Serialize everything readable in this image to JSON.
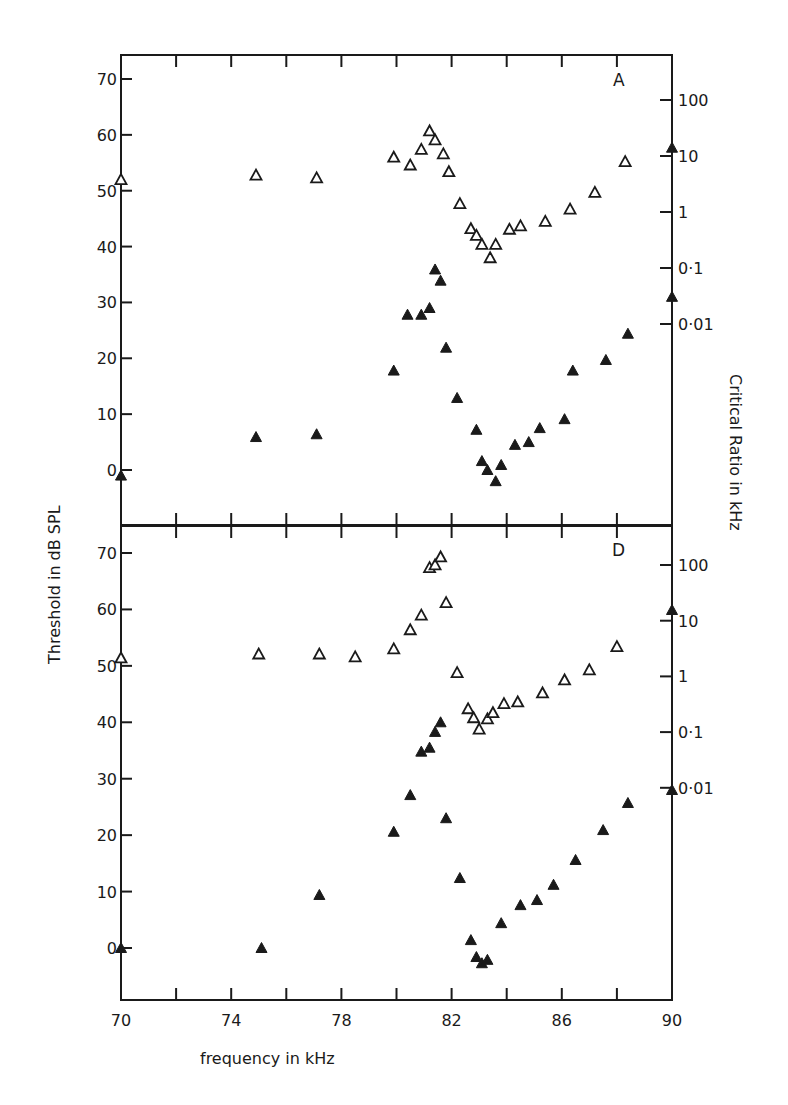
{
  "chart_data": [
    {
      "type": "scatter",
      "panel_label": "A",
      "xlabel": "frequency in kHz",
      "ylabel": "Threshold in dB SPL",
      "y2label": "Critical Ratio in kHz",
      "xlim": [
        70,
        90
      ],
      "ylim": [
        -10,
        75
      ],
      "x_ticks": [
        70,
        72,
        74,
        76,
        78,
        80,
        82,
        84,
        86,
        88,
        90
      ],
      "x_tick_labels": [
        "70",
        "74",
        "78",
        "82",
        "86",
        "90"
      ],
      "y_ticks": [
        0,
        10,
        20,
        30,
        40,
        50,
        60,
        70
      ],
      "y2_ticks": [
        "100",
        "10",
        "1",
        "0·1",
        "0·01"
      ],
      "series": [
        {
          "name": "critical ratio (open triangles)",
          "marker": "open-triangle",
          "points": [
            [
              70.0,
              52
            ],
            [
              74.9,
              52.8
            ],
            [
              77.1,
              52.3
            ],
            [
              79.9,
              56
            ],
            [
              80.5,
              54.6
            ],
            [
              80.9,
              57.4
            ],
            [
              81.2,
              60.7
            ],
            [
              81.4,
              59.1
            ],
            [
              81.7,
              56.6
            ],
            [
              81.9,
              53.4
            ],
            [
              82.3,
              47.7
            ],
            [
              82.7,
              43.2
            ],
            [
              82.9,
              42
            ],
            [
              83.1,
              40.4
            ],
            [
              83.4,
              38
            ],
            [
              83.6,
              40.4
            ],
            [
              84.1,
              43.1
            ],
            [
              84.5,
              43.7
            ],
            [
              85.4,
              44.5
            ],
            [
              86.3,
              46.7
            ],
            [
              87.2,
              49.7
            ],
            [
              88.3,
              55.2
            ]
          ]
        },
        {
          "name": "threshold (filled triangles)",
          "marker": "filled-triangle",
          "points": [
            [
              70.0,
              -1
            ],
            [
              74.9,
              5.9
            ],
            [
              77.1,
              6.4
            ],
            [
              79.9,
              17.8
            ],
            [
              80.4,
              27.8
            ],
            [
              80.9,
              27.8
            ],
            [
              81.2,
              29
            ],
            [
              81.4,
              35.9
            ],
            [
              81.6,
              33.9
            ],
            [
              81.8,
              21.9
            ],
            [
              82.2,
              12.9
            ],
            [
              82.9,
              7.2
            ],
            [
              83.1,
              1.6
            ],
            [
              83.3,
              0
            ],
            [
              83.6,
              -2
            ],
            [
              83.8,
              0.9
            ],
            [
              84.3,
              4.5
            ],
            [
              84.8,
              5
            ],
            [
              85.2,
              7.5
            ],
            [
              86.1,
              9.1
            ],
            [
              86.4,
              17.8
            ],
            [
              87.6,
              19.7
            ],
            [
              88.4,
              24.4
            ],
            [
              90.0,
              31
            ],
            [
              90.0,
              57.7
            ]
          ]
        }
      ]
    },
    {
      "type": "scatter",
      "panel_label": "D",
      "xlabel": "frequency in kHz",
      "ylabel": "Threshold in dB SPL",
      "y2label": "Critical Ratio in kHz",
      "xlim": [
        70,
        90
      ],
      "ylim": [
        -10,
        75
      ],
      "x_ticks": [
        70,
        72,
        74,
        76,
        78,
        80,
        82,
        84,
        86,
        88,
        90
      ],
      "x_tick_labels": [
        "70",
        "74",
        "78",
        "82",
        "86",
        "90"
      ],
      "y_ticks": [
        0,
        10,
        20,
        30,
        40,
        50,
        60,
        70
      ],
      "y2_ticks": [
        "100",
        "10",
        "1",
        "0·1",
        "0·01"
      ],
      "series": [
        {
          "name": "critical ratio (open triangles)",
          "marker": "open-triangle",
          "points": [
            [
              70.0,
              51.4
            ],
            [
              75.0,
              52.1
            ],
            [
              77.2,
              52.1
            ],
            [
              78.5,
              51.6
            ],
            [
              79.9,
              53
            ],
            [
              80.5,
              56.4
            ],
            [
              80.9,
              59
            ],
            [
              81.2,
              67.4
            ],
            [
              81.4,
              67.9
            ],
            [
              81.6,
              69.3
            ],
            [
              81.8,
              61.2
            ],
            [
              82.2,
              48.8
            ],
            [
              82.6,
              42.4
            ],
            [
              82.8,
              40.8
            ],
            [
              83.0,
              38.8
            ],
            [
              83.3,
              40.6
            ],
            [
              83.5,
              41.7
            ],
            [
              83.9,
              43.3
            ],
            [
              84.4,
              43.6
            ],
            [
              85.3,
              45.2
            ],
            [
              86.1,
              47.5
            ],
            [
              87.0,
              49.3
            ],
            [
              88.0,
              53.4
            ]
          ]
        },
        {
          "name": "threshold (filled triangles)",
          "marker": "filled-triangle",
          "points": [
            [
              70.0,
              0
            ],
            [
              75.1,
              0
            ],
            [
              77.2,
              9.4
            ],
            [
              79.9,
              20.6
            ],
            [
              80.5,
              27.1
            ],
            [
              80.9,
              34.8
            ],
            [
              81.2,
              35.5
            ],
            [
              81.4,
              38.3
            ],
            [
              81.6,
              40
            ],
            [
              81.8,
              23
            ],
            [
              82.3,
              12.4
            ],
            [
              82.7,
              1.4
            ],
            [
              82.9,
              -1.6
            ],
            [
              83.1,
              -2.7
            ],
            [
              83.3,
              -2.1
            ],
            [
              83.8,
              4.4
            ],
            [
              84.5,
              7.6
            ],
            [
              85.1,
              8.5
            ],
            [
              85.7,
              11.2
            ],
            [
              86.5,
              15.6
            ],
            [
              87.5,
              20.9
            ],
            [
              88.4,
              25.7
            ],
            [
              90.0,
              28
            ],
            [
              90.0,
              59.9
            ]
          ]
        }
      ]
    }
  ],
  "labels": {
    "panel_a": "A",
    "panel_d": "D",
    "xlabel": "frequency in kHz",
    "ylabel": "Threshold in dB SPL",
    "y2label": "Critical Ratio in kHz"
  }
}
